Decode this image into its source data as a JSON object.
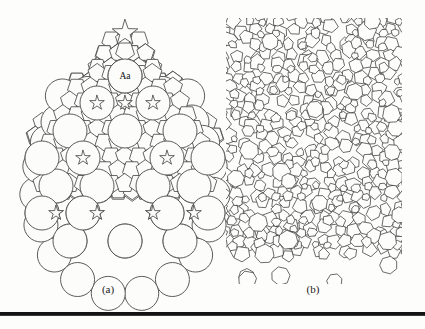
{
  "figure": {
    "background_color": "#fdfdfc",
    "line_color": "#4a4a4a",
    "rule_color": "#141414",
    "panels": [
      {
        "id": "a",
        "caption": "(a)",
        "description": "pentagonal quasicrystal cluster with star apex",
        "labels": [
          {
            "text": "Aa",
            "x": 103,
            "y": 66
          }
        ]
      },
      {
        "id": "b",
        "caption": "(b)",
        "description": "dense random pentagonal tiling"
      }
    ]
  },
  "chart_data": {
    "type": "diagram",
    "title": "",
    "panel_a": {
      "caption": "(a)",
      "shape_outline": "teardrop",
      "apex_marker": "five-pointed-star",
      "label": "Aa",
      "tile_types": [
        "pentagon",
        "decagon",
        "five-pointed-star",
        "rhombus",
        "boat"
      ],
      "symmetry": "mirror about vertical axis",
      "pentagon_edge": 11.6,
      "large_disc_radius": 17.0,
      "large_disc_centers": [
        [
          103,
          66
        ],
        [
          48,
          121
        ],
        [
          103,
          121
        ],
        [
          158,
          121
        ],
        [
          33,
          176
        ],
        [
          74,
          176
        ],
        [
          132,
          176
        ],
        [
          173,
          176
        ],
        [
          48,
          231
        ],
        [
          103,
          231
        ],
        [
          158,
          231
        ],
        [
          48,
          121
        ],
        [
          158,
          121
        ]
      ],
      "star_positions": [
        [
          103,
          22
        ],
        [
          74,
          93
        ],
        [
          132,
          93
        ],
        [
          60,
          148
        ],
        [
          146,
          148
        ],
        [
          74,
          203
        ],
        [
          132,
          203
        ]
      ]
    },
    "panel_b": {
      "caption": "(b)",
      "tiling": "random pentagonal (Penrose-like dense packing)",
      "grid_columns": 13,
      "grid_rows": 20,
      "cell_size": 13.6,
      "jitter": 0.34,
      "seed": 20240716,
      "boundary": "rectangular, ragged edges"
    }
  }
}
